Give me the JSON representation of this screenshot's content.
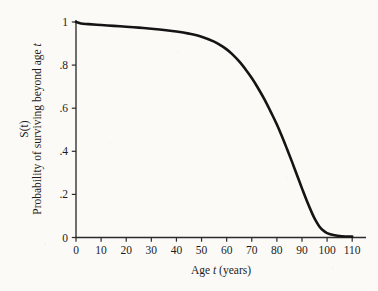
{
  "chart_data": {
    "type": "line",
    "title": "",
    "subtitle": "",
    "xlabel_parts": {
      "lead": "Age ",
      "italic": "t",
      "trail": " (years)"
    },
    "xlabel": "Age t (years)",
    "ylabel_symbol": "S(t)",
    "ylabel": "Probability of surviving beyond age t",
    "ylabel_parts": {
      "lead": "Probability of surviving beyond age ",
      "italic": "t"
    },
    "xlim": [
      0,
      110
    ],
    "ylim": [
      0,
      1
    ],
    "xticks": [
      0,
      10,
      20,
      30,
      40,
      50,
      60,
      70,
      80,
      90,
      100,
      110
    ],
    "xtick_labels": [
      "0",
      "10",
      "20",
      "30",
      "40",
      "50",
      "60",
      "70",
      "80",
      "90",
      "100",
      "110"
    ],
    "yticks": [
      0,
      0.2,
      0.4,
      0.6,
      0.8,
      1
    ],
    "ytick_labels": [
      "0",
      ".2",
      ".4",
      ".6",
      ".8",
      "1"
    ],
    "grid": false,
    "legend": false,
    "legend_position": "none",
    "line_color": "#141414",
    "line_width": 2.6,
    "axis_color": "#2b2b2b",
    "background_color": "#fbfaf7",
    "series": [
      {
        "name": "S(t)",
        "x": [
          0,
          2,
          5,
          10,
          15,
          20,
          25,
          30,
          35,
          40,
          45,
          50,
          55,
          58,
          60,
          62,
          65,
          68,
          70,
          72,
          75,
          78,
          80,
          82,
          84,
          86,
          88,
          90,
          92,
          94,
          95,
          96,
          97,
          98,
          100,
          103,
          106,
          110
        ],
        "y": [
          1.0,
          0.993,
          0.99,
          0.986,
          0.982,
          0.978,
          0.974,
          0.969,
          0.963,
          0.956,
          0.946,
          0.932,
          0.909,
          0.889,
          0.873,
          0.853,
          0.817,
          0.773,
          0.74,
          0.703,
          0.642,
          0.573,
          0.524,
          0.47,
          0.412,
          0.352,
          0.29,
          0.228,
          0.168,
          0.113,
          0.089,
          0.068,
          0.05,
          0.037,
          0.02,
          0.01,
          0.006,
          0.004
        ]
      }
    ]
  },
  "figure": {
    "caption": ""
  }
}
